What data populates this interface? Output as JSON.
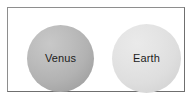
{
  "figure": {
    "background_color": "#ffffff",
    "frame": {
      "border_color": "#8e8e8e",
      "fill_color": "#ffffff"
    },
    "planets": [
      {
        "name": "venus",
        "label": "Venus",
        "fill_color": "#b2b2b2",
        "label_color": "#1c1c1c",
        "relative_size": "smaller"
      },
      {
        "name": "earth",
        "label": "Earth",
        "fill_color": "#dedede",
        "label_color": "#1c1c1c",
        "relative_size": "larger"
      }
    ]
  }
}
